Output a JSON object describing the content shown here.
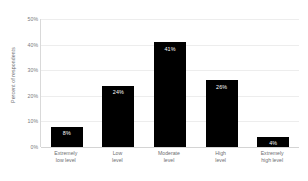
{
  "chart_data": {
    "type": "bar",
    "title": "",
    "xlabel": "",
    "ylabel": "Percent of respondents",
    "categories": [
      "Extremely\nlow level",
      "Low\nlevel",
      "Moderate\nlevel",
      "High\nlevel",
      "Extremely\nhigh level"
    ],
    "category_lines": [
      [
        "Extremely",
        "low level"
      ],
      [
        "Low",
        "level"
      ],
      [
        "Moderate",
        "level"
      ],
      [
        "High",
        "level"
      ],
      [
        "Extremely",
        "high level"
      ]
    ],
    "values": [
      8,
      24,
      41,
      26,
      4
    ],
    "data_labels": [
      "8%",
      "24%",
      "41%",
      "26%",
      "4%"
    ],
    "ylim": [
      0,
      50
    ],
    "yticks": [
      0,
      10,
      20,
      30,
      40,
      50
    ],
    "ytick_labels": [
      "0%",
      "10%",
      "20%",
      "30%",
      "40%",
      "50%"
    ],
    "grid": true,
    "legend": false,
    "bar_color": "#000000",
    "data_label_color": "#ffffff",
    "gridline_color": "#ededed",
    "axis_color": "#d9d9d9",
    "background_color": "#ffffff",
    "tick_label_color": "#7a7b7d"
  }
}
